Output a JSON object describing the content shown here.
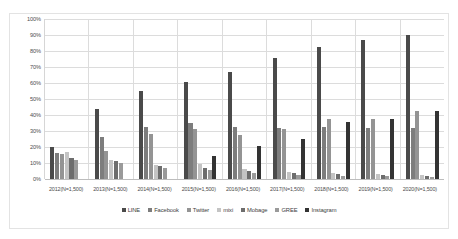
{
  "chart_data": {
    "type": "bar",
    "title": "",
    "subtitle": "",
    "xlabel": "",
    "ylabel": "",
    "ylim": [
      0,
      100
    ],
    "grid": true,
    "legend_position": "bottom",
    "categories": [
      "2012(N=1,500)",
      "2013(N=1,500)",
      "2014(N=1,500)",
      "2015(N=1,500)",
      "2016(N=1,500)",
      "2017(N=1,500)",
      "2018(N=1,500)",
      "2019(N=1,500)",
      "2020(N=1,500)"
    ],
    "ticks": [
      "0%",
      "10%",
      "20%",
      "30%",
      "40%",
      "50%",
      "60%",
      "70%",
      "80%",
      "90%",
      "100%"
    ],
    "tick_values": [
      0,
      10,
      20,
      30,
      40,
      50,
      60,
      70,
      80,
      90,
      100
    ],
    "series": [
      {
        "name": "LINE",
        "color": "#4a4a4a",
        "values": [
          20.3,
          44.0,
          55.1,
          60.6,
          67.0,
          75.8,
          82.3,
          86.9,
          90.3
        ]
      },
      {
        "name": "Facebook",
        "color": "#7d7d7d",
        "values": [
          16.4,
          26.1,
          32.5,
          35.3,
          32.3,
          31.9,
          32.8,
          32.1,
          31.9
        ]
      },
      {
        "name": "Twitter",
        "color": "#949494",
        "values": [
          15.7,
          17.5,
          28.3,
          31.0,
          27.5,
          31.1,
          37.3,
          37.8,
          42.3
        ]
      },
      {
        "name": "mixi",
        "color": "#c4c4c4",
        "values": [
          16.6,
          12.0,
          8.6,
          9.4,
          6.5,
          4.5,
          3.7,
          2.9,
          2.7
        ]
      },
      {
        "name": "Mobage",
        "color": "#6d6d6d",
        "values": [
          13.0,
          11.3,
          8.3,
          7.1,
          5.2,
          3.5,
          3.0,
          2.2,
          2.1
        ]
      },
      {
        "name": "GREE",
        "color": "#9a9a9a",
        "values": [
          12.0,
          10.2,
          6.8,
          5.6,
          3.6,
          2.7,
          2.1,
          1.7,
          1.5
        ]
      },
      {
        "name": "Instagram",
        "color": "#333333",
        "values": [
          0.0,
          0.0,
          0.0,
          14.3,
          20.5,
          25.1,
          35.5,
          37.8,
          42.3
        ]
      }
    ]
  },
  "legend": {
    "items": [
      {
        "label": "LINE"
      },
      {
        "label": "Facebook"
      },
      {
        "label": "Twitter"
      },
      {
        "label": "mixi"
      },
      {
        "label": "Mobage"
      },
      {
        "label": "GREE"
      },
      {
        "label": "Instagram"
      }
    ]
  }
}
